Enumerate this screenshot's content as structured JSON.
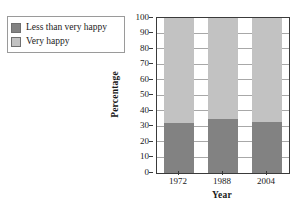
{
  "chart_data": {
    "type": "bar",
    "subtype": "stacked-bar-100",
    "title": "",
    "xlabel": "Year",
    "ylabel": "Percentage",
    "categories": [
      "1972",
      "1988",
      "2004"
    ],
    "series": [
      {
        "name": "Very happy",
        "color": "#c2c2c2",
        "values": [
          68,
          65,
          67
        ]
      },
      {
        "name": "Less than very happy",
        "color": "#828282",
        "values": [
          32,
          35,
          33
        ]
      }
    ],
    "stack_order": [
      "Less than very happy",
      "Very happy"
    ],
    "ylim": [
      0,
      100
    ],
    "ytick_values": [
      0,
      10,
      20,
      30,
      40,
      50,
      60,
      70,
      80,
      90,
      100
    ],
    "ytick_labels": [
      "0",
      "10",
      "20",
      "30",
      "40",
      "50",
      "60",
      "70",
      "80",
      "90",
      "100"
    ],
    "grid": "horizontal",
    "legend_position": "top-left-outside"
  },
  "legend": {
    "items": [
      {
        "label": "Less than very happy",
        "color": "#828282"
      },
      {
        "label": "Very happy",
        "color": "#c2c2c2"
      }
    ]
  },
  "colors": {
    "dark_segment": "#828282",
    "light_segment": "#c2c2c2",
    "axis": "#3a3a3a",
    "gridline": "#a8a8a8",
    "background": "#ffffff"
  }
}
